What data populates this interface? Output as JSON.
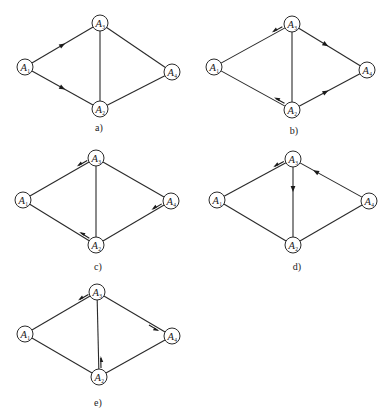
{
  "colors": {
    "ink": "#2a2a2a",
    "background": "#ffffff"
  },
  "node_radius": 8,
  "diagrams": [
    {
      "id": "a",
      "caption": "a)",
      "caption_pos": [
        99,
        131
      ],
      "nodes": [
        {
          "name": "A",
          "sub": "1",
          "x": 25,
          "y": 67
        },
        {
          "name": "A",
          "sub": "3",
          "x": 100,
          "y": 23
        },
        {
          "name": "A",
          "sub": "4",
          "x": 172,
          "y": 72
        },
        {
          "name": "A",
          "sub": "2",
          "x": 100,
          "y": 109
        }
      ],
      "edges": [
        [
          0,
          1
        ],
        [
          0,
          3
        ],
        [
          1,
          3
        ],
        [
          1,
          2
        ],
        [
          3,
          2
        ]
      ],
      "arrows": [
        {
          "from": 0,
          "to": 1,
          "t": 0.5,
          "style": "inline"
        },
        {
          "from": 0,
          "to": 3,
          "t": 0.5,
          "style": "inline"
        }
      ]
    },
    {
      "id": "b",
      "caption": "b)",
      "caption_pos": [
        294,
        134
      ],
      "nodes": [
        {
          "name": "A",
          "sub": "1",
          "x": 214,
          "y": 67
        },
        {
          "name": "A",
          "sub": "3",
          "x": 292,
          "y": 24
        },
        {
          "name": "A",
          "sub": "4",
          "x": 367,
          "y": 70
        },
        {
          "name": "A",
          "sub": "2",
          "x": 292,
          "y": 110
        }
      ],
      "edges": [
        [
          0,
          1
        ],
        [
          0,
          3
        ],
        [
          1,
          3
        ],
        [
          1,
          2
        ],
        [
          3,
          2
        ]
      ],
      "arrows": [
        {
          "from": 1,
          "to": 0,
          "t": 0.2,
          "style": "offset"
        },
        {
          "from": 3,
          "to": 0,
          "t": 0.2,
          "style": "offset"
        },
        {
          "from": 1,
          "to": 2,
          "t": 0.45,
          "style": "inline"
        },
        {
          "from": 3,
          "to": 2,
          "t": 0.45,
          "style": "inline"
        }
      ]
    },
    {
      "id": "c",
      "caption": "c)",
      "caption_pos": [
        98,
        270
      ],
      "nodes": [
        {
          "name": "A",
          "sub": "1",
          "x": 23,
          "y": 200
        },
        {
          "name": "A",
          "sub": "3",
          "x": 96,
          "y": 158
        },
        {
          "name": "A",
          "sub": "4",
          "x": 171,
          "y": 201
        },
        {
          "name": "A",
          "sub": "2",
          "x": 96,
          "y": 245
        }
      ],
      "edges": [
        [
          0,
          1
        ],
        [
          0,
          3
        ],
        [
          1,
          3
        ],
        [
          1,
          2
        ],
        [
          3,
          2
        ]
      ],
      "arrows": [
        {
          "from": 1,
          "to": 0,
          "t": 0.2,
          "style": "offset"
        },
        {
          "from": 3,
          "to": 0,
          "t": 0.2,
          "style": "offset"
        },
        {
          "from": 2,
          "to": 3,
          "t": 0.2,
          "style": "offset"
        }
      ]
    },
    {
      "id": "d",
      "caption": "d)",
      "caption_pos": [
        297,
        270
      ],
      "nodes": [
        {
          "name": "A",
          "sub": "1",
          "x": 217,
          "y": 200
        },
        {
          "name": "A",
          "sub": "3",
          "x": 293,
          "y": 159
        },
        {
          "name": "A",
          "sub": "4",
          "x": 369,
          "y": 201
        },
        {
          "name": "A",
          "sub": "2",
          "x": 293,
          "y": 245
        }
      ],
      "edges": [
        [
          0,
          1
        ],
        [
          0,
          3
        ],
        [
          1,
          3
        ],
        [
          1,
          2
        ],
        [
          3,
          2
        ]
      ],
      "arrows": [
        {
          "from": 1,
          "to": 0,
          "t": 0.2,
          "style": "offset"
        },
        {
          "from": 1,
          "to": 3,
          "t": 0.35,
          "style": "inline"
        },
        {
          "from": 2,
          "to": 1,
          "t": 0.7,
          "style": "inline"
        }
      ]
    },
    {
      "id": "e",
      "caption": "e)",
      "caption_pos": [
        98,
        406
      ],
      "nodes": [
        {
          "name": "A",
          "sub": "1",
          "x": 25,
          "y": 334
        },
        {
          "name": "A",
          "sub": "3",
          "x": 97,
          "y": 292
        },
        {
          "name": "A",
          "sub": "4",
          "x": 172,
          "y": 336
        },
        {
          "name": "A",
          "sub": "2",
          "x": 99,
          "y": 377
        }
      ],
      "edges": [
        [
          0,
          1
        ],
        [
          0,
          3
        ],
        [
          1,
          3
        ],
        [
          1,
          2
        ],
        [
          3,
          2
        ]
      ],
      "arrows": [
        {
          "from": 1,
          "to": 0,
          "t": 0.2,
          "style": "offset"
        },
        {
          "from": 1,
          "to": 2,
          "t": 0.8,
          "style": "offset"
        },
        {
          "from": 3,
          "to": 1,
          "t": 0.2,
          "style": "offset"
        }
      ]
    }
  ]
}
